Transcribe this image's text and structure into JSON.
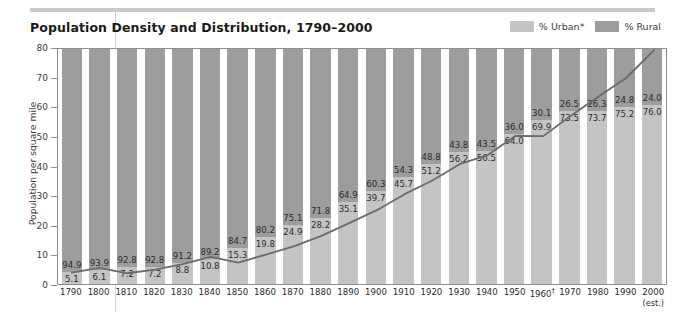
{
  "title": "Population Density and Distribution, 1790–2000",
  "legend": {
    "items": [
      {
        "label": "% Urban*",
        "color": "#c4c4c4",
        "name": "urban"
      },
      {
        "label": "% Rural",
        "color": "#9d9d9d",
        "name": "rural"
      }
    ]
  },
  "chart_data": {
    "type": "bar",
    "title": "Population Density and Distribution, 1790–2000",
    "xlabel": "",
    "ylabel": "Population per square mile",
    "ylim": [
      0,
      80
    ],
    "yticks": [
      0,
      10,
      20,
      30,
      40,
      50,
      60,
      70,
      80
    ],
    "grid": false,
    "legend_position": "top-right",
    "stacked": true,
    "categories": [
      "1790",
      "1800",
      "1810",
      "1820",
      "1830",
      "1840",
      "1850",
      "1860",
      "1870",
      "1880",
      "1890",
      "1900",
      "1910",
      "1920",
      "1930",
      "1940",
      "1950",
      "1960†",
      "1970",
      "1980",
      "1990",
      "2000"
    ],
    "category_notes": {
      "1960": "†",
      "2000": "(est.)"
    },
    "series": [
      {
        "name": "% Urban*",
        "color": "#c4c4c4",
        "values": [
          5.1,
          6.1,
          7.2,
          7.2,
          8.8,
          10.8,
          15.3,
          19.8,
          24.9,
          28.2,
          35.1,
          39.7,
          45.7,
          51.2,
          56.2,
          56.5,
          64.0,
          69.9,
          73.5,
          73.7,
          75.2,
          76.0
        ]
      },
      {
        "name": "% Rural",
        "color": "#9d9d9d",
        "values": [
          94.9,
          93.9,
          92.8,
          92.8,
          91.2,
          89.2,
          84.7,
          80.2,
          75.1,
          71.8,
          64.9,
          60.3,
          54.3,
          48.8,
          43.8,
          43.5,
          36.0,
          30.1,
          26.5,
          26.3,
          24.8,
          24.0
        ]
      }
    ],
    "overlay_line": {
      "name": "Population per square mile",
      "color": "#6b6b6b",
      "values": [
        4.5,
        6.1,
        4.3,
        5.5,
        7.4,
        9.8,
        7.9,
        10.6,
        13.4,
        16.9,
        21.2,
        25.6,
        31.0,
        35.6,
        41.2,
        44.2,
        50.7,
        50.6,
        57.5,
        64.0,
        70.3,
        79.6
      ]
    }
  }
}
